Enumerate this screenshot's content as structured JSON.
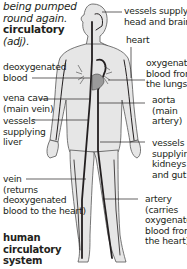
{
  "entry": {
    "definition_tail": [
      "being pumped",
      "round again."
    ],
    "derived_word": "circulatory",
    "derived_pos": "(adj)."
  },
  "figure": {
    "title": [
      "human",
      "circulatory",
      "system"
    ],
    "labels": {
      "head_vessels": [
        "vessels supplying",
        "head and brain"
      ],
      "heart": [
        "heart"
      ],
      "deoxygenated": [
        "deoxygenated",
        "blood"
      ],
      "oxygenated": [
        "oxygenated",
        "blood from",
        "the lungs"
      ],
      "vena_cava": [
        "vena cava",
        "(main vein)"
      ],
      "aorta": [
        "aorta",
        "(main",
        "artery)"
      ],
      "liver_vessels": [
        "vessels",
        "supplying",
        "liver"
      ],
      "kidney_vessels": [
        "vessels",
        "supplying",
        "kidneys",
        "and gut"
      ],
      "vein": [
        "vein",
        "(returns",
        "deoxygenated",
        "blood to the heart)"
      ],
      "artery": [
        "artery",
        "(carries",
        "oxygenated",
        "blood from",
        "the heart)"
      ]
    },
    "colors": {
      "body_fill": "#e6e6e6",
      "line": "#231f20",
      "text": "#231f20"
    }
  }
}
